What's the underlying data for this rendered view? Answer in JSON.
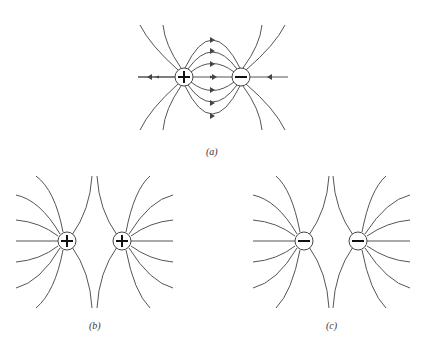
{
  "figure": {
    "panels": [
      {
        "id": "a",
        "label": "(a)",
        "description": "Field lines between a positive and a negative charge (dipole)",
        "charges": [
          "+",
          "−"
        ]
      },
      {
        "id": "b",
        "label": "(b)",
        "description": "Field lines of two equal positive charges",
        "charges": [
          "+",
          "+"
        ]
      },
      {
        "id": "c",
        "label": "(c)",
        "description": "Field lines of two equal negative charges",
        "charges": [
          "−",
          "−"
        ]
      }
    ]
  }
}
